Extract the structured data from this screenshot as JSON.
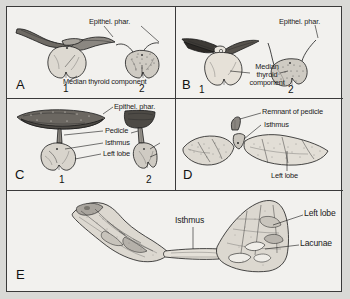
{
  "figure": {
    "background_color": "#f2f1ee",
    "border_color": "#3a3a3a",
    "type": "scientific-illustration"
  },
  "panels": [
    {
      "letter": "A",
      "specimens": [
        "1",
        "2"
      ],
      "labels": [
        {
          "text": "Epithel. phar."
        },
        {
          "text": "Median thyroid component"
        }
      ]
    },
    {
      "letter": "B",
      "specimens": [
        "1",
        "2"
      ],
      "labels": [
        {
          "text": "Epithel. phar."
        },
        {
          "text": "Median"
        },
        {
          "text": "thyroid"
        },
        {
          "text": "component"
        }
      ]
    },
    {
      "letter": "C",
      "specimens": [
        "1",
        "2"
      ],
      "labels": [
        {
          "text": "Epithel. phar."
        },
        {
          "text": "Pedicle"
        },
        {
          "text": "Isthmus"
        },
        {
          "text": "Left lobe"
        }
      ]
    },
    {
      "letter": "D",
      "specimens": [],
      "labels": [
        {
          "text": "Remnant of pedicle"
        },
        {
          "text": "Isthmus"
        },
        {
          "text": "Left lobe"
        }
      ]
    },
    {
      "letter": "E",
      "specimens": [],
      "labels": [
        {
          "text": "Isthmus"
        },
        {
          "text": "Left lobe"
        },
        {
          "text": "Lacunae"
        }
      ]
    }
  ],
  "panel_a": {
    "letter": "A",
    "label_epithel": "Epithel. phar.",
    "label_median": "Median thyroid component",
    "num1": "1",
    "num2": "2"
  },
  "panel_b": {
    "letter": "B",
    "label_epithel": "Epithel. phar.",
    "label_median_1": "Median",
    "label_median_2": "thyroid",
    "label_median_3": "component",
    "num1": "1",
    "num2": "2"
  },
  "panel_c": {
    "letter": "C",
    "label_epithel": "Epithel. phar.",
    "label_pedicle": "Pedicle",
    "label_isthmus": "Isthmus",
    "label_leftlobe": "Left lobe",
    "num1": "1",
    "num2": "2"
  },
  "panel_d": {
    "letter": "D",
    "label_remnant": "Remnant of pedicle",
    "label_isthmus": "Isthmus",
    "label_leftlobe": "Left lobe"
  },
  "panel_e": {
    "letter": "E",
    "label_isthmus": "Isthmus",
    "label_leftlobe": "Left lobe",
    "label_lacunae": "Lacunae"
  }
}
